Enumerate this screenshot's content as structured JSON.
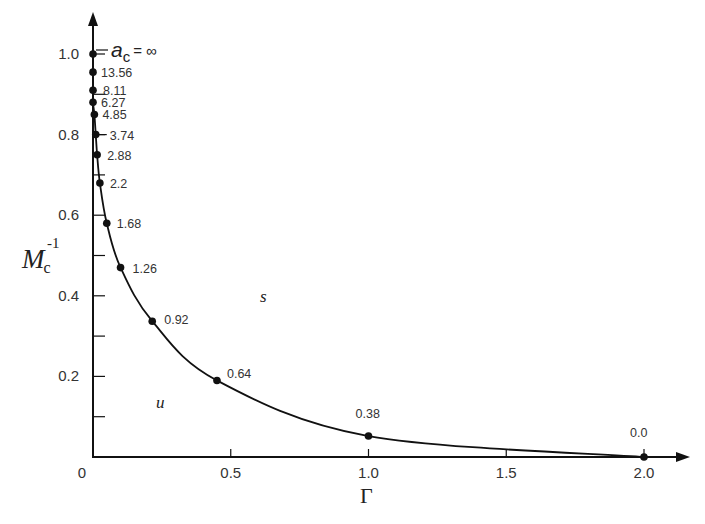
{
  "chart_data": {
    "type": "line",
    "title": "",
    "xlabel": "Γ",
    "ylabel": "M_c^-1",
    "ylabel_main": "M",
    "ylabel_sub": "c",
    "ylabel_sup": "-1",
    "xlim": [
      0,
      2.1
    ],
    "ylim": [
      0,
      1.05
    ],
    "x_ticks": [
      0,
      0.5,
      1.0,
      1.5,
      2.0
    ],
    "x_tick_labels": [
      "0",
      "0.5",
      "1.0",
      "1.5",
      "2.0"
    ],
    "y_ticks": [
      0.2,
      0.4,
      0.6,
      0.8,
      1.0
    ],
    "y_tick_labels": [
      "0.2",
      "0.4",
      "0.6",
      "0.8",
      "1.0"
    ],
    "y_minor_ticks": [
      0.1,
      0.3,
      0.5,
      0.7,
      0.9
    ],
    "grid": false,
    "legend": null,
    "series": [
      {
        "name": "critical curve",
        "point_label_param": "a_c",
        "points": [
          {
            "x": 0.0,
            "y": 1.0,
            "label": "∞"
          },
          {
            "x": 0.0,
            "y": 0.955,
            "label": "13.56"
          },
          {
            "x": 0.0,
            "y": 0.91,
            "label": "8.11"
          },
          {
            "x": 0.0,
            "y": 0.88,
            "label": "6.27"
          },
          {
            "x": 0.005,
            "y": 0.85,
            "label": "4.85"
          },
          {
            "x": 0.01,
            "y": 0.8,
            "label": "3.74"
          },
          {
            "x": 0.015,
            "y": 0.75,
            "label": "2.88"
          },
          {
            "x": 0.025,
            "y": 0.68,
            "label": "2.2"
          },
          {
            "x": 0.05,
            "y": 0.58,
            "label": "1.68"
          },
          {
            "x": 0.1,
            "y": 0.47,
            "label": "1.26"
          },
          {
            "x": 0.215,
            "y": 0.337,
            "label": "0.92"
          },
          {
            "x": 0.45,
            "y": 0.19,
            "label": "0.64"
          },
          {
            "x": 1.0,
            "y": 0.052,
            "label": "0.38"
          },
          {
            "x": 2.0,
            "y": 0.0,
            "label": "0.0"
          }
        ]
      }
    ],
    "annotations": [
      {
        "text": "a_c = ∞",
        "main": "a",
        "sub": "c",
        "rest": " = ∞",
        "x": 0.0,
        "y": 1.0
      },
      {
        "text": "s",
        "x": 0.63,
        "y": 0.4,
        "meaning": "stable region"
      },
      {
        "text": "u",
        "x": 0.24,
        "y": 0.13,
        "meaning": "unstable region"
      }
    ]
  },
  "axes": {
    "origin_label": "0",
    "x_label": "Γ"
  },
  "labels": {
    "ac_main": "a",
    "ac_sub": "c",
    "ac_eq": "= ∞",
    "region_s": "s",
    "region_u": "u"
  }
}
